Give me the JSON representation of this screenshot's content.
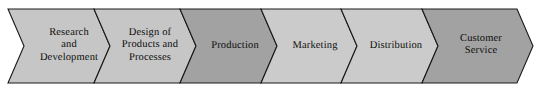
{
  "diagram": {
    "type": "value-chain-arrow-process",
    "title": "",
    "background_color": "#ffffff",
    "outline_color": "#1a1a1a",
    "text_color": "#0c0c0c",
    "band": {
      "top": 9,
      "bottom": 83,
      "left": 8,
      "right": 533
    },
    "segments": [
      {
        "id": "research-and-development",
        "label": "Research\nand\nDevelopment",
        "lines": [
          "Research",
          "and",
          "Development"
        ],
        "fill": "#c6c6c6",
        "shade": "light",
        "x_start": 8,
        "x_end": 110,
        "label_cx": 69,
        "label_cy": 46
      },
      {
        "id": "design-of-products-and-processes",
        "label": "Design of\nProducts and\nProcesses",
        "lines": [
          "Design of",
          "Products and",
          "Processes"
        ],
        "fill": "#c6c6c6",
        "shade": "light",
        "x_start": 110,
        "x_end": 196,
        "label_cx": 150,
        "label_cy": 46
      },
      {
        "id": "production",
        "label": "Production",
        "lines": [
          "Production"
        ],
        "fill": "#a2a2a2",
        "shade": "dark",
        "x_start": 196,
        "x_end": 277,
        "label_cx": 235,
        "label_cy": 46
      },
      {
        "id": "marketing",
        "label": "Marketing",
        "lines": [
          "Marketing"
        ],
        "fill": "#cbcbcb",
        "shade": "light",
        "x_start": 277,
        "x_end": 357,
        "label_cx": 315,
        "label_cy": 46
      },
      {
        "id": "distribution",
        "label": "Distribution",
        "lines": [
          "Distribution"
        ],
        "fill": "#cbcbcb",
        "shade": "light",
        "x_start": 357,
        "x_end": 438,
        "label_cx": 396,
        "label_cy": 46
      },
      {
        "id": "customer-service",
        "label": "Customer\nService",
        "lines": [
          "Customer",
          "Service"
        ],
        "fill": "#a2a2a2",
        "shade": "dark",
        "x_start": 438,
        "x_end": 533,
        "label_cx": 481,
        "label_cy": 46
      }
    ]
  }
}
